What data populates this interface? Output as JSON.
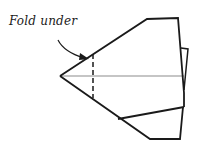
{
  "diagram": {
    "type": "paper-airplane-folding-step",
    "annotation": {
      "label": "Fold under",
      "arrow_points_to": "dashed-fold-line"
    },
    "colors": {
      "stroke": "#1a1a1a",
      "center_line": "#8c8c8c",
      "background": "#ffffff"
    }
  }
}
